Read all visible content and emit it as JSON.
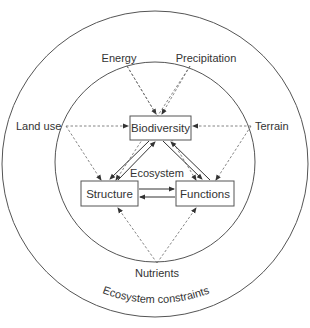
{
  "diagram": {
    "outer_label": "Ecosystem constraints",
    "center_label": "Ecosystem",
    "nodes": {
      "biodiversity": "Biodiversity",
      "structure": "Structure",
      "functions": "Functions"
    },
    "drivers": {
      "energy": "Energy",
      "precipitation": "Precipitation",
      "land_use": "Land use",
      "terrain": "Terrain",
      "nutrients": "Nutrients"
    },
    "colors": {
      "line": "#444444",
      "text": "#333333",
      "background": "#ffffff"
    },
    "edges": {
      "solid": [
        "Biodiversity -> Structure",
        "Structure -> Biodiversity",
        "Biodiversity -> Functions",
        "Functions -> Biodiversity",
        "Structure -> Functions",
        "Functions -> Structure"
      ],
      "dashed": [
        "Energy -> Biodiversity",
        "Energy -> Functions",
        "Precipitation -> Biodiversity",
        "Precipitation -> Structure",
        "Land use -> Biodiversity",
        "Land use -> Structure",
        "Terrain -> Biodiversity",
        "Terrain -> Functions",
        "Nutrients -> Structure",
        "Nutrients -> Functions"
      ]
    }
  }
}
